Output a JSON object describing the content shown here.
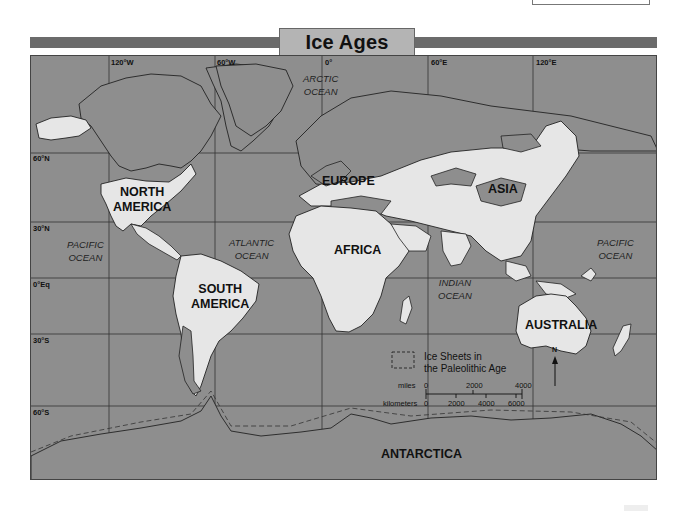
{
  "title": "Ice Ages",
  "map": {
    "longitude_labels": [
      "120°W",
      "60°W",
      "0°",
      "60°E",
      "120°E"
    ],
    "latitude_labels": [
      "60°N",
      "30°N",
      "0°Eq",
      "30°S",
      "60°S"
    ],
    "continents": {
      "north_america": "NORTH AMERICA",
      "north_america_l1": "NORTH",
      "north_america_l2": "AMERICA",
      "south_america_l1": "SOUTH",
      "south_america_l2": "AMERICA",
      "europe": "EUROPE",
      "asia": "ASIA",
      "africa": "AFRICA",
      "australia": "AUSTRALIA",
      "antarctica": "ANTARCTICA"
    },
    "oceans": {
      "arctic_l1": "ARCTIC",
      "arctic_l2": "OCEAN",
      "pacific_west_l1": "PACIFIC",
      "pacific_west_l2": "OCEAN",
      "atlantic_l1": "ATLANTIC",
      "atlantic_l2": "OCEAN",
      "indian_l1": "INDIAN",
      "indian_l2": "OCEAN",
      "pacific_east_l1": "PACIFIC",
      "pacific_east_l2": "OCEAN"
    },
    "legend": {
      "line1": "Ice Sheets in",
      "line2": "the Paleolithic Age",
      "symbol": "dashed-box"
    },
    "scale": {
      "miles_label": "miles",
      "miles_ticks": [
        "0",
        "2000",
        "4000"
      ],
      "km_label": "kilometers",
      "km_ticks": [
        "0",
        "2000",
        "4000",
        "6000"
      ]
    },
    "north_arrow": "N",
    "colors": {
      "ocean": "#8e8e8e",
      "land_unglaciated": "#e6e6e6",
      "land_glaciated": "#8e8e8e",
      "title_bar": "#6b6b6b",
      "title_tab": "#b4b4b4"
    }
  }
}
